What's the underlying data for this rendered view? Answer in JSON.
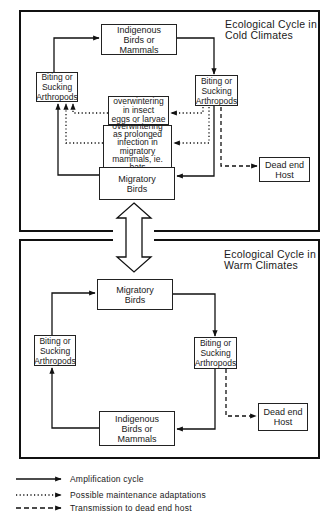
{
  "cold_panel": {
    "title": "Ecological Cycle in\nCold Climates",
    "nodes": {
      "indigenous": "Indigenous\nBirds or\nMammals",
      "arthropods_left": "Biting or\nSucking\nArthropods",
      "arthropods_right": "Biting or\nSucking\nArthropods",
      "overwinter_eggs": "overwintering\nin insect\neggs or larvae",
      "overwinter_bats": "overwintering\nas prolonged\ninfection in\nmigratory\nmammals, ie. bats",
      "migratory": "Migratory\nBirds",
      "dead_end": "Dead end\nHost"
    }
  },
  "warm_panel": {
    "title": "Ecological Cycle in\nWarm Climates",
    "nodes": {
      "migratory": "Migratory\nBirds",
      "arthropods_left": "Biting or\nSucking\nArthropods",
      "arthropods_right": "Biting or\nSucking\nArthropods",
      "indigenous": "Indigenous\nBirds or\nMammals",
      "dead_end": "Dead end\nHost"
    }
  },
  "legend": {
    "items": [
      {
        "style": "solid",
        "label": "Amplification cycle"
      },
      {
        "style": "dotted",
        "label": "Possible maintenance adaptations"
      },
      {
        "style": "dashed",
        "label": "Transmission to dead end host"
      }
    ]
  }
}
